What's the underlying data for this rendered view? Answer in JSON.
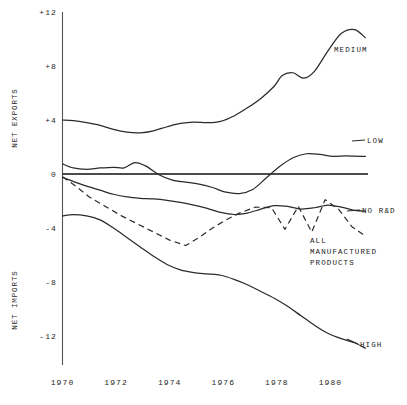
{
  "chart_data": {
    "type": "line",
    "title": "",
    "subtitle": "",
    "xlabel": "",
    "ylabel_top": "NET EXPORTS",
    "ylabel_bottom": "NET IMPORTS",
    "grid": false,
    "legend_position": "inline-right",
    "xlim": [
      1970,
      1981.4
    ],
    "ylim": [
      -13.5,
      12.6
    ],
    "x_ticks": [
      "1970",
      "1972",
      "1974",
      "1976",
      "1978",
      "1980"
    ],
    "x_tick_values": [
      1970,
      1972,
      1974,
      1976,
      1978,
      1980
    ],
    "y_ticks": [
      "+12",
      "+8",
      "+4",
      "0",
      "-4",
      "-8",
      "-12"
    ],
    "y_tick_values": [
      12,
      8,
      4,
      0,
      -4,
      -8,
      -12
    ],
    "zero_reference_line": 0,
    "series": [
      {
        "name": "MEDIUM",
        "style": "solid",
        "label": "MEDIUM",
        "x": [
          1970,
          1970.4,
          1970.9,
          1971.4,
          1971.9,
          1972.4,
          1972.9,
          1973.4,
          1973.9,
          1974.4,
          1974.9,
          1975.4,
          1975.9,
          1976.4,
          1976.9,
          1977.4,
          1977.9,
          1978.2,
          1978.6,
          1979.0,
          1979.4,
          1979.9,
          1980.4,
          1980.9,
          1981.3
        ],
        "values": [
          4.0,
          3.95,
          3.8,
          3.6,
          3.3,
          3.1,
          3.05,
          3.2,
          3.5,
          3.75,
          3.85,
          3.8,
          3.9,
          4.3,
          4.9,
          5.6,
          6.5,
          7.3,
          7.5,
          7.1,
          7.6,
          9.1,
          10.4,
          10.7,
          10.1
        ]
      },
      {
        "name": "LOW",
        "style": "solid",
        "label": "LOW",
        "x": [
          1970,
          1970.4,
          1970.9,
          1971.4,
          1971.9,
          1972.3,
          1972.7,
          1973.1,
          1973.6,
          1974.1,
          1974.6,
          1975.1,
          1975.6,
          1976.1,
          1976.6,
          1977.1,
          1977.6,
          1978.1,
          1978.6,
          1979.1,
          1979.6,
          1980.1,
          1980.6,
          1981.3
        ],
        "values": [
          0.75,
          0.45,
          0.35,
          0.45,
          0.5,
          0.45,
          0.85,
          0.6,
          -0.05,
          -0.45,
          -0.6,
          -0.75,
          -1.0,
          -1.35,
          -1.45,
          -1.15,
          -0.3,
          0.55,
          1.2,
          1.5,
          1.45,
          1.3,
          1.35,
          1.3
        ]
      },
      {
        "name": "NO R&D",
        "style": "solid",
        "label": "NO R&D",
        "x": [
          1970,
          1970.4,
          1970.9,
          1971.4,
          1971.9,
          1972.4,
          1972.9,
          1973.4,
          1973.9,
          1974.4,
          1974.9,
          1975.4,
          1975.9,
          1976.4,
          1976.9,
          1977.4,
          1977.9,
          1978.4,
          1978.9,
          1979.4,
          1979.9,
          1980.4,
          1980.9,
          1981.3
        ],
        "values": [
          -0.25,
          -0.55,
          -0.9,
          -1.2,
          -1.5,
          -1.7,
          -1.8,
          -1.85,
          -1.95,
          -2.1,
          -2.3,
          -2.55,
          -2.85,
          -3.0,
          -2.9,
          -2.6,
          -2.35,
          -2.4,
          -2.6,
          -2.5,
          -2.3,
          -2.45,
          -2.7,
          -2.75
        ]
      },
      {
        "name": "ALL MANUFACTURED PRODUCTS",
        "style": "dashed",
        "label": "ALL\nMANUFACTURED\nPRODUCTS",
        "x": [
          1970,
          1970.5,
          1971.0,
          1971.6,
          1972.2,
          1972.8,
          1973.4,
          1974.0,
          1974.6,
          1975.1,
          1975.6,
          1976.1,
          1976.6,
          1977.2,
          1977.8,
          1978.3,
          1978.8,
          1979.3,
          1979.8,
          1980.3,
          1980.8,
          1981.3
        ],
        "values": [
          -0.2,
          -0.9,
          -1.7,
          -2.4,
          -3.1,
          -3.7,
          -4.3,
          -4.9,
          -5.3,
          -4.7,
          -4.0,
          -3.4,
          -2.9,
          -2.45,
          -2.5,
          -4.1,
          -2.4,
          -4.3,
          -1.9,
          -2.6,
          -3.9,
          -4.6
        ]
      },
      {
        "name": "HIGH",
        "style": "solid",
        "label": "HIGH",
        "x": [
          1970,
          1970.4,
          1970.9,
          1971.4,
          1971.9,
          1972.4,
          1972.9,
          1973.4,
          1973.9,
          1974.4,
          1974.9,
          1975.4,
          1975.9,
          1976.4,
          1976.9,
          1977.4,
          1977.9,
          1978.4,
          1978.9,
          1979.4,
          1979.9,
          1980.4,
          1980.9,
          1981.3
        ],
        "values": [
          -3.1,
          -3.0,
          -3.1,
          -3.4,
          -4.0,
          -4.7,
          -5.4,
          -6.1,
          -6.7,
          -7.1,
          -7.3,
          -7.4,
          -7.5,
          -7.8,
          -8.2,
          -8.7,
          -9.2,
          -9.8,
          -10.5,
          -11.2,
          -11.8,
          -12.2,
          -12.5,
          -12.9
        ]
      }
    ]
  },
  "axis": {
    "exports_label": "NET EXPORTS",
    "imports_label": "NET IMPORTS"
  },
  "labels": {
    "medium": "MEDIUM",
    "low": "LOW",
    "no_rd": "NO R&D",
    "all_line1": "ALL",
    "all_line2": "MANUFACTURED",
    "all_line3": "PRODUCTS",
    "high": "HIGH"
  },
  "colors": {
    "ink": "#2b2b2b",
    "axis": "#555555",
    "background": "#ffffff"
  }
}
